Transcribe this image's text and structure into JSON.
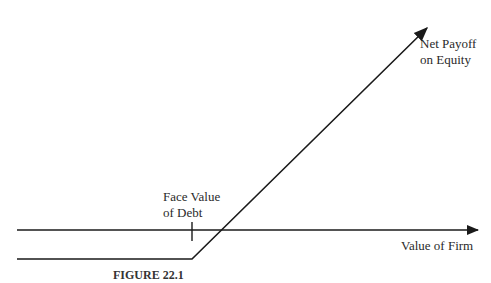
{
  "diagram": {
    "labels": {
      "payoff_line_1": "Net Payoff",
      "payoff_line_2": "on Equity",
      "face_value_1": "Face Value",
      "face_value_2": "of Debt",
      "x_axis": "Value of Firm"
    },
    "caption": {
      "figure_number": "FIGURE 22.1",
      "note": "caption text clipped at bottom edge"
    },
    "colors": {
      "line": "#1a1a1a",
      "background": "#ffffff"
    }
  }
}
